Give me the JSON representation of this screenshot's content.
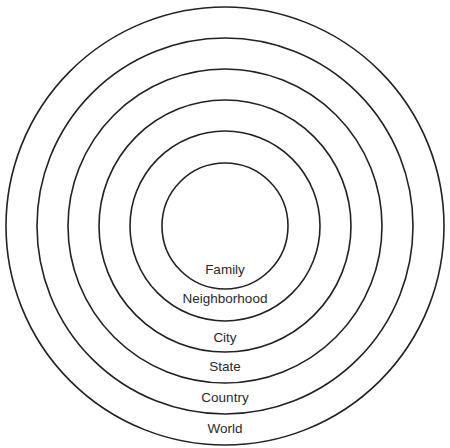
{
  "diagram": {
    "type": "concentric-circles",
    "center": {
      "x": 225,
      "y": 226
    },
    "stroke_color": "#222222",
    "rings": [
      {
        "label": "Family",
        "radius": 63,
        "label_y": 262
      },
      {
        "label": "Neighborhood",
        "radius": 95,
        "label_y": 291
      },
      {
        "label": "City",
        "radius": 126,
        "label_y": 330
      },
      {
        "label": "State",
        "radius": 157,
        "label_y": 359
      },
      {
        "label": "Country",
        "radius": 188,
        "label_y": 390
      },
      {
        "label": "World",
        "radius": 219,
        "label_y": 421
      }
    ]
  }
}
